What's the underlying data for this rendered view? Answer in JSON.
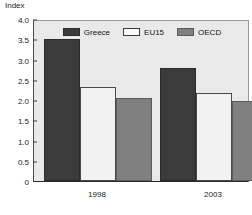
{
  "chart_data": {
    "type": "bar",
    "title": "",
    "xlabel": "",
    "ylabel": "Index",
    "categories": [
      "1998",
      "2003"
    ],
    "series": [
      {
        "name": "Greece",
        "color": "#3b3b3b",
        "values": [
          3.5,
          2.8
        ]
      },
      {
        "name": "EU15",
        "color": "#f1f1f1",
        "values": [
          2.32,
          2.18
        ]
      },
      {
        "name": "OECD",
        "color": "#808080",
        "values": [
          2.06,
          1.98
        ]
      }
    ],
    "ylim": [
      0,
      4.0
    ],
    "ytick_values": [
      4.0,
      3.5,
      3.0,
      2.5,
      2.0,
      1.5,
      1.0,
      0.5,
      0
    ],
    "ytick_labels": [
      "4.0",
      "3.5",
      "3.0",
      "2.5",
      "2.0",
      "1.5",
      "1.0",
      "0.5",
      "0"
    ],
    "grid": false,
    "legend_position": "top-center"
  },
  "legend": {
    "items": [
      {
        "label": "Greece",
        "swatch": "greece"
      },
      {
        "label": "EU15",
        "swatch": "eu15"
      },
      {
        "label": "OECD",
        "swatch": "oecd"
      }
    ]
  },
  "colors": {
    "greece": "#3b3b3b",
    "eu15": "#f1f1f1",
    "oecd": "#808080",
    "plot_background": "#e9e9e9",
    "page_background": "#ffffff",
    "axis": "#2a2a2a",
    "text": "#1a1a1a"
  }
}
